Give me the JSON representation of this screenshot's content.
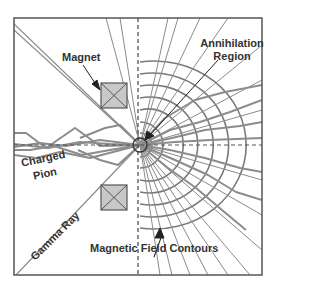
{
  "diagram": {
    "type": "physics-schematic",
    "labels": {
      "magnet": "Magnet",
      "annihilation_line1": "Annihilation",
      "annihilation_line2": "Region",
      "charged_line1": "Charged",
      "charged_line2": "Pion",
      "gamma_ray": "Gamma Ray",
      "field_contours": "Magnetic Field Contours"
    },
    "colors": {
      "frame": "#555555",
      "track": "#8a8a8a",
      "contour": "#777777",
      "magnet_fill": "#c8c8c8",
      "magnet_stroke": "#555555",
      "text": "#333333",
      "arrow": "#222222"
    }
  }
}
